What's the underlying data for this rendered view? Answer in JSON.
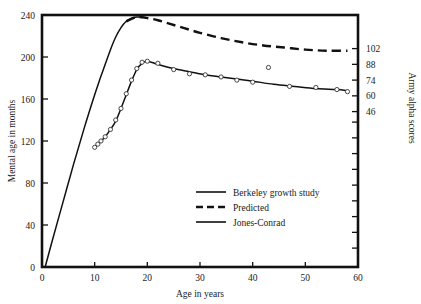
{
  "chart_data": {
    "type": "line",
    "title": "",
    "xlabel": "Age in years",
    "ylabel": "Mental age in months",
    "y2label": "Army alpha scores",
    "xlim": [
      0,
      60
    ],
    "ylim": [
      0,
      240
    ],
    "grid": false,
    "legend_position": "inside-lower-center",
    "xticks": [
      0,
      10,
      20,
      30,
      40,
      50,
      60
    ],
    "xticklabels": [
      "0",
      "10",
      "20",
      "30",
      "40",
      "50",
      "60"
    ],
    "yticks": [
      0,
      40,
      80,
      120,
      160,
      200,
      240
    ],
    "yticklabels": [
      "0",
      "40",
      "80",
      "120",
      "160",
      "200",
      "240"
    ],
    "y2ticks": [
      46,
      60,
      74,
      88,
      102
    ],
    "y2ticklabels": [
      "46",
      "60",
      "74",
      "88",
      "102"
    ],
    "y2_tick_mental_age": [
      148,
      163,
      178,
      193,
      208
    ],
    "y2_minor_mental_age": [
      18,
      33,
      48,
      63,
      78,
      93,
      108,
      123,
      138
    ],
    "series": [
      {
        "name": "Jones-Conrad",
        "style": "solid",
        "marker": "none",
        "x": [
          0.6,
          2,
          4,
          6,
          8,
          10,
          11,
          12,
          13,
          14,
          15,
          16,
          17,
          18,
          19,
          20
        ],
        "y": [
          0,
          26,
          62,
          98,
          132,
          164,
          179,
          193,
          207,
          219,
          228,
          234,
          237,
          238,
          238,
          237
        ]
      },
      {
        "name": "Predicted",
        "style": "dashed",
        "marker": "none",
        "x": [
          16,
          18,
          20,
          22,
          24,
          26,
          28,
          30,
          34,
          38,
          42,
          46,
          50,
          54,
          58
        ],
        "y": [
          234,
          238,
          237,
          235,
          232,
          229,
          226,
          223,
          218,
          214,
          211,
          209,
          207,
          206,
          206
        ]
      },
      {
        "name": "Berkeley growth study",
        "style": "solid",
        "marker": "circle",
        "x": [
          10,
          10.6,
          11.2,
          12,
          13,
          14,
          15,
          16,
          17,
          18,
          19,
          20,
          22,
          25,
          28,
          31,
          34,
          37,
          40,
          44,
          48,
          52,
          56,
          58
        ],
        "y": [
          114,
          117,
          120,
          124,
          131,
          139,
          151,
          164,
          177,
          188,
          194,
          196,
          193,
          189,
          186,
          183,
          181,
          179,
          177,
          174,
          172,
          170,
          169,
          168
        ]
      }
    ],
    "scatter_points": {
      "name": "Berkeley growth study observations",
      "marker": "open-circle",
      "x": [
        10,
        10.6,
        11.2,
        12,
        13,
        14,
        15,
        16,
        17,
        18,
        19,
        20,
        22,
        25,
        28,
        31,
        34,
        37,
        40,
        43,
        47,
        52,
        56,
        58
      ],
      "y": [
        114,
        117,
        120,
        124,
        131,
        140,
        151,
        165,
        178,
        189,
        195,
        196,
        194,
        188,
        184,
        183,
        181,
        178,
        176,
        190,
        172,
        171,
        169,
        167
      ]
    },
    "legend": [
      {
        "label": "Berkeley growth study",
        "style": "solid"
      },
      {
        "label": "Predicted",
        "style": "dashed"
      },
      {
        "label": "Jones-Conrad",
        "style": "solid"
      }
    ]
  },
  "colors": {
    "ink": "#111111",
    "background": "#ffffff",
    "marker_edge": "#333333",
    "marker_fill": "#ffffff"
  }
}
